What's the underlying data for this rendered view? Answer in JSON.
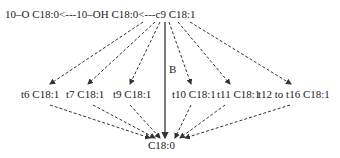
{
  "diagram": {
    "top_row": {
      "oxo": "10–O C18:0",
      "arrow1": "<---",
      "hydroxy": "10–OH C18:0",
      "arrow2": "<---",
      "c9": "c9 C18:1"
    },
    "middle_row": [
      {
        "id": "t6",
        "label": "t6 C18:1"
      },
      {
        "id": "t7",
        "label": "t7 C18:1"
      },
      {
        "id": "t9",
        "label": "t9 C18:1"
      },
      {
        "id": "t10",
        "label": "t10 C18:1"
      },
      {
        "id": "t11",
        "label": "t11 C18:1"
      },
      {
        "id": "t12-t16",
        "label": "t12 to t16 C18:1"
      }
    ],
    "bottom": {
      "label": "C18:0"
    },
    "direct_path_label": "B",
    "colors": {
      "line": "#333333",
      "text": "#222222",
      "background": "#ffffff"
    }
  }
}
